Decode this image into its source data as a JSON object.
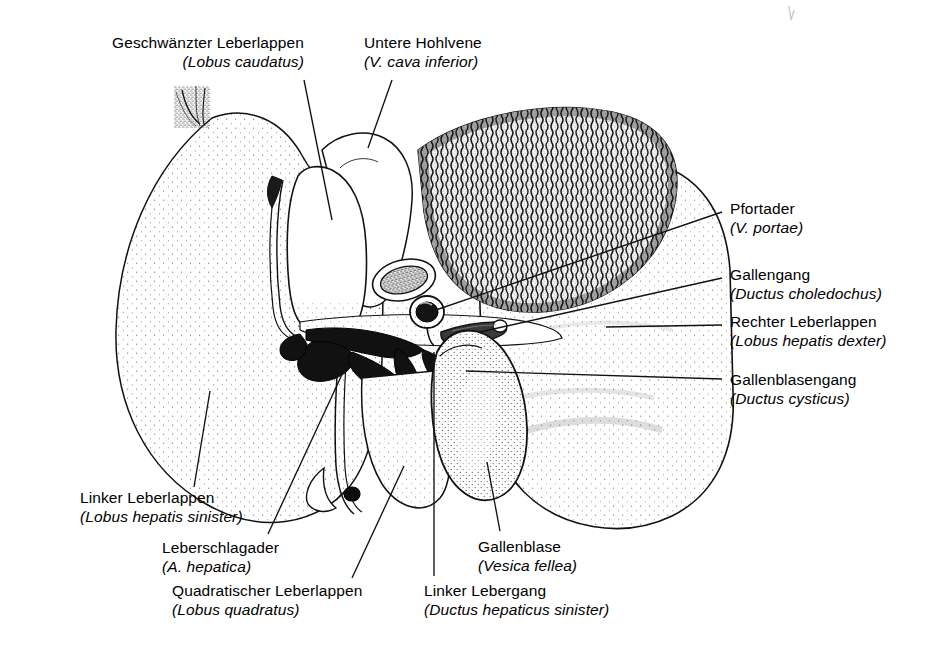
{
  "figure": {
    "kind": "anatomical-illustration",
    "style": "stippled pen-and-ink line drawing, black on white",
    "colors": {
      "ink": "#111111",
      "paper": "#ffffff",
      "leader_line": "#111111"
    }
  },
  "labels": [
    {
      "id": "lobus-caudatus",
      "german": "Geschwänzter Leberlappen",
      "latin": "(Lobus caudatus)",
      "align": "right",
      "x": 112,
      "y": 34,
      "leader": {
        "from_x": 304,
        "from_y": 80,
        "to_x": 332,
        "to_y": 220
      }
    },
    {
      "id": "vena-cava-inferior",
      "german": "Untere Hohlvene",
      "latin": "(V. cava inferior)",
      "align": "left",
      "x": 364,
      "y": 34,
      "leader": {
        "from_x": 392,
        "from_y": 80,
        "to_x": 368,
        "to_y": 148
      }
    },
    {
      "id": "vena-portae",
      "german": "Pfortader",
      "latin": "(V. portae)",
      "align": "left",
      "x": 730,
      "y": 200,
      "leader": {
        "from_x": 722,
        "from_y": 212,
        "to_x": 430,
        "to_y": 312
      }
    },
    {
      "id": "ductus-choledochus",
      "german": "Gallengang",
      "latin": "(Ductus choledochus)",
      "align": "left",
      "x": 730,
      "y": 266,
      "leader": {
        "from_x": 722,
        "from_y": 278,
        "to_x": 480,
        "to_y": 332
      }
    },
    {
      "id": "lobus-hepatis-dexter",
      "german": "Rechter Leberlappen",
      "latin": "(Lobus hepatis dexter)",
      "align": "left",
      "x": 730,
      "y": 313,
      "leader": {
        "from_x": 722,
        "from_y": 325,
        "to_x": 606,
        "to_y": 327
      }
    },
    {
      "id": "ductus-cysticus",
      "german": "Gallenblasengang",
      "latin": "(Ductus cysticus)",
      "align": "left",
      "x": 730,
      "y": 371,
      "leader": {
        "from_x": 722,
        "from_y": 379,
        "to_x": 466,
        "to_y": 371
      }
    },
    {
      "id": "lobus-hepatis-sinister",
      "german": "Linker Leberlappen",
      "latin": "(Lobus hepatis sinister)",
      "align": "left",
      "x": 80,
      "y": 489,
      "leader": {
        "from_x": 194,
        "from_y": 487,
        "to_x": 210,
        "to_y": 391
      }
    },
    {
      "id": "arteria-hepatica",
      "german": "Leberschlagader",
      "latin": "(A. hepatica)",
      "align": "left",
      "x": 162,
      "y": 539,
      "leader": {
        "from_x": 268,
        "from_y": 534,
        "to_x": 352,
        "to_y": 353
      }
    },
    {
      "id": "lobus-quadratus",
      "german": "Quadratischer Leberlappen",
      "latin": "(Lobus quadratus)",
      "align": "left",
      "x": 172,
      "y": 582,
      "leader": {
        "from_x": 352,
        "from_y": 578,
        "to_x": 404,
        "to_y": 466
      }
    },
    {
      "id": "ductus-hepaticus-sinister",
      "german": "Linker Lebergang",
      "latin": "(Ductus hepaticus sinister)",
      "align": "left",
      "x": 424,
      "y": 582,
      "leader": {
        "from_x": 434,
        "from_y": 576,
        "to_x": 434,
        "to_y": 352
      }
    },
    {
      "id": "vesica-fellea",
      "german": "Gallenblase",
      "latin": "(Vesica fellea)",
      "align": "left",
      "x": 478,
      "y": 538,
      "leader": {
        "from_x": 500,
        "from_y": 531,
        "to_x": 487,
        "to_y": 462
      }
    }
  ],
  "structures": [
    {
      "id": "left-lobe",
      "name": "Linker Leberlappen"
    },
    {
      "id": "right-lobe",
      "name": "Rechter Leberlappen"
    },
    {
      "id": "caudate-lobe",
      "name": "Geschwänzter Leberlappen"
    },
    {
      "id": "quadrate-lobe",
      "name": "Quadratischer Leberlappen"
    },
    {
      "id": "gallbladder",
      "name": "Gallenblase"
    },
    {
      "id": "inferior-vena-cava",
      "name": "Untere Hohlvene"
    },
    {
      "id": "portal-vein",
      "name": "Pfortader"
    },
    {
      "id": "bile-duct",
      "name": "Gallengang"
    },
    {
      "id": "cystic-duct",
      "name": "Gallenblasengang"
    },
    {
      "id": "hepatic-artery",
      "name": "Leberschlagader"
    },
    {
      "id": "left-hepatic-duct",
      "name": "Linker Lebergang"
    },
    {
      "id": "bare-area",
      "name": "Haftfläche / Area nuda"
    },
    {
      "id": "fibrous-stalk",
      "name": "Aufhängeband"
    }
  ]
}
